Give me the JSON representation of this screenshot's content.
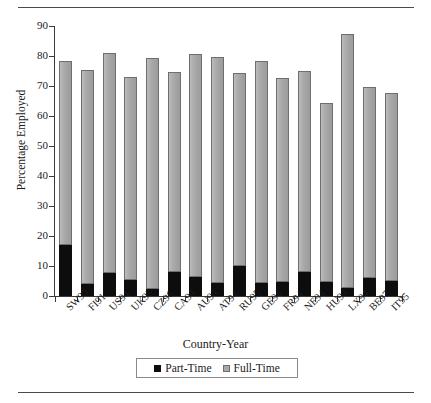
{
  "chart_data": {
    "type": "bar",
    "subtype": "stacked-bar",
    "title": "",
    "xlabel": "Country-Year",
    "ylabel": "Percentage Employed",
    "ylim": [
      0,
      90
    ],
    "ytick_step": 10,
    "yticks": [
      0,
      10,
      20,
      30,
      40,
      50,
      60,
      70,
      80,
      90
    ],
    "ytick_labels": [
      "0",
      "10",
      "20",
      "30",
      "40",
      "50",
      "60",
      "70",
      "80",
      "90"
    ],
    "grid": false,
    "legend_position": "bottom-center",
    "categories": [
      "SW95",
      "FI91",
      "US94",
      "UK95",
      "CZ96",
      "CA94",
      "AU94",
      "AT94",
      "RU95",
      "GE94",
      "FR94",
      "NE94",
      "HU94",
      "LX94",
      "BE97",
      "IT95"
    ],
    "series": [
      {
        "name": "Part-Time",
        "color": "#0d0d0d",
        "values": [
          17.0,
          4.0,
          7.8,
          5.5,
          2.5,
          8.0,
          6.5,
          4.3,
          9.9,
          4.4,
          4.8,
          8.0,
          4.8,
          2.8,
          6.0,
          4.9
        ]
      },
      {
        "name": "Full-Time",
        "color": "#a9a9a9",
        "values": [
          61.2,
          71.2,
          73.1,
          67.5,
          76.9,
          66.8,
          74.1,
          75.4,
          64.6,
          74.0,
          67.9,
          66.9,
          59.7,
          84.4,
          63.7,
          62.7
        ]
      }
    ],
    "totals": [
      78.2,
      75.2,
      80.9,
      73.0,
      79.4,
      74.8,
      80.6,
      79.7,
      74.5,
      78.4,
      72.7,
      74.9,
      64.5,
      87.2,
      69.7,
      67.6
    ]
  },
  "legend": {
    "items": [
      {
        "label": "Part-Time",
        "swatch": "black-square"
      },
      {
        "label": "Full-Time",
        "swatch": "gray-square"
      }
    ]
  }
}
